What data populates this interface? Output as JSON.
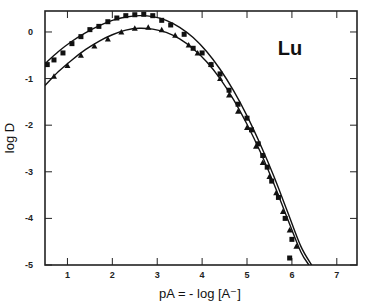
{
  "chart_data": {
    "type": "scatter",
    "title": "",
    "annotation": "Lu",
    "xlabel": "pA = - log [A⁻]",
    "ylabel": "log D",
    "xlim": [
      0.5,
      7.45
    ],
    "ylim": [
      -5,
      0.45
    ],
    "xticks": [
      1,
      2,
      3,
      4,
      5,
      6,
      7
    ],
    "yticks": [
      0,
      -1,
      -2,
      -3,
      -4,
      -5
    ],
    "xtick_labels": [
      "1",
      "2",
      "3",
      "4",
      "5",
      "6",
      "7"
    ],
    "ytick_labels": [
      "0",
      "-1",
      "-2",
      "-3",
      "-4",
      "-5"
    ],
    "grid": false,
    "legend": "none",
    "series": [
      {
        "name": "upper fit",
        "kind": "line",
        "x": [
          0.5,
          0.8,
          1.1,
          1.4,
          1.7,
          2.0,
          2.3,
          2.6,
          2.9,
          3.2,
          3.5,
          3.8,
          4.1,
          4.4,
          4.7,
          5.0,
          5.3,
          5.6,
          5.9,
          6.2,
          6.44
        ],
        "y": [
          -0.68,
          -0.42,
          -0.2,
          -0.02,
          0.13,
          0.25,
          0.32,
          0.35,
          0.33,
          0.25,
          0.1,
          -0.12,
          -0.42,
          -0.8,
          -1.26,
          -1.8,
          -2.42,
          -3.1,
          -3.85,
          -4.6,
          -5.0
        ]
      },
      {
        "name": "lower fit",
        "kind": "line",
        "x": [
          0.5,
          0.8,
          1.1,
          1.4,
          1.7,
          2.0,
          2.3,
          2.6,
          2.9,
          3.2,
          3.5,
          3.8,
          4.1,
          4.4,
          4.7,
          5.0,
          5.3,
          5.6,
          5.9,
          6.2,
          6.38
        ],
        "y": [
          -1.15,
          -0.85,
          -0.6,
          -0.38,
          -0.2,
          -0.06,
          0.04,
          0.08,
          0.06,
          -0.01,
          -0.15,
          -0.36,
          -0.64,
          -1.0,
          -1.45,
          -1.98,
          -2.58,
          -3.26,
          -4.0,
          -4.72,
          -5.0
        ]
      },
      {
        "name": "upper data",
        "kind": "points",
        "marker": "square",
        "x": [
          0.55,
          0.7,
          0.9,
          1.1,
          1.3,
          1.5,
          1.7,
          1.9,
          2.1,
          2.3,
          2.5,
          2.7,
          2.9,
          3.1,
          3.3,
          3.6,
          3.8,
          4.0,
          4.2,
          4.4,
          4.6,
          4.8,
          5.0,
          5.1,
          5.25,
          5.35,
          5.45,
          5.55,
          5.7,
          5.85,
          6.0
        ],
        "y": [
          -0.7,
          -0.6,
          -0.45,
          -0.25,
          -0.1,
          0.05,
          0.12,
          0.22,
          0.3,
          0.35,
          0.37,
          0.38,
          0.35,
          0.25,
          0.15,
          -0.05,
          -0.35,
          -0.45,
          -0.7,
          -0.9,
          -1.25,
          -1.55,
          -1.85,
          -2.1,
          -2.4,
          -2.65,
          -2.9,
          -3.2,
          -3.55,
          -4.0,
          -4.45
        ]
      },
      {
        "name": "lower data",
        "kind": "points",
        "marker": "triangle",
        "x": [
          0.7,
          1.0,
          1.3,
          1.6,
          1.9,
          2.2,
          2.5,
          2.8,
          3.1,
          3.4,
          3.7,
          3.9,
          4.2,
          4.4,
          4.6,
          4.8,
          5.0,
          5.2,
          5.35,
          5.5,
          5.65,
          5.8,
          5.95,
          6.1
        ],
        "y": [
          -0.95,
          -0.72,
          -0.5,
          -0.3,
          -0.15,
          0.0,
          0.08,
          0.1,
          0.05,
          -0.07,
          -0.28,
          -0.45,
          -0.7,
          -1.0,
          -1.35,
          -1.7,
          -2.05,
          -2.45,
          -2.8,
          -3.1,
          -3.45,
          -3.85,
          -4.25,
          -4.6
        ]
      },
      {
        "name": "outlier",
        "kind": "points",
        "marker": "square",
        "x": [
          5.95
        ],
        "y": [
          -4.85
        ]
      }
    ]
  }
}
